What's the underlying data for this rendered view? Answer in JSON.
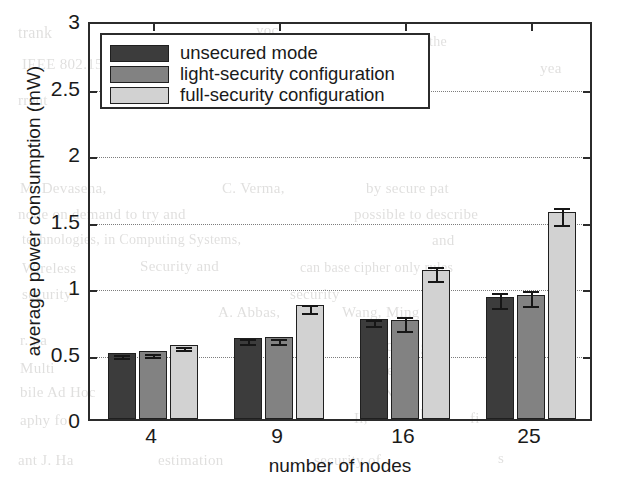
{
  "chart_data": {
    "type": "bar",
    "title": "",
    "xlabel": "number of nodes",
    "ylabel": "average power consumption (mW)",
    "categories": [
      "4",
      "9",
      "16",
      "25"
    ],
    "ylim": [
      0,
      3
    ],
    "yticks": [
      "0",
      "0.5",
      "1",
      "1.5",
      "2",
      "2.5",
      "3"
    ],
    "ytick_values": [
      0,
      0.5,
      1,
      1.5,
      2,
      2.5,
      3
    ],
    "grid": "dotted horizontal gridlines",
    "legend_position": "upper left (inside axes)",
    "series": [
      {
        "name": "unsecured mode",
        "color": "#3c3c3c",
        "values": [
          0.5,
          0.61,
          0.755,
          0.92
        ],
        "errors": [
          0.012,
          0.018,
          0.022,
          0.055
        ]
      },
      {
        "name": "light-security configuration",
        "color": "#828282",
        "values": [
          0.51,
          0.615,
          0.745,
          0.935
        ],
        "errors": [
          0.012,
          0.02,
          0.055,
          0.055
        ]
      },
      {
        "name": "full-security configuration",
        "color": "#d2d2d2",
        "values": [
          0.56,
          0.86,
          1.12,
          1.555
        ],
        "errors": [
          0.013,
          0.03,
          0.055,
          0.065
        ]
      }
    ]
  },
  "figure": {
    "axis_color": "#2b2b2b",
    "grid_color": "#7d7d7d",
    "background": "#ffffff"
  },
  "bleed_text": [
    {
      "t": "trank",
      "x": 18,
      "y": 24,
      "s": 16
    },
    {
      "t": "yoc",
      "x": 256,
      "y": 22,
      "s": 15
    },
    {
      "t": "IEEE 802.15.4 standard",
      "x": 22,
      "y": 56,
      "s": 15
    },
    {
      "t": "national",
      "x": 352,
      "y": 58,
      "s": 15
    },
    {
      "t": "rrent",
      "x": 18,
      "y": 92,
      "s": 15
    },
    {
      "t": "it in a master-slave scheme",
      "x": 210,
      "y": 96,
      "s": 15
    },
    {
      "t": "M. Devasena,",
      "x": 20,
      "y": 180,
      "s": 15
    },
    {
      "t": "C. Verma,",
      "x": 222,
      "y": 180,
      "s": 15
    },
    {
      "t": "by secure pat",
      "x": 366,
      "y": 180,
      "s": 15
    },
    {
      "t": "node on demand to try and",
      "x": 18,
      "y": 206,
      "s": 15
    },
    {
      "t": "possible to describe",
      "x": 354,
      "y": 206,
      "s": 15
    },
    {
      "t": "technologies, in Computing Systems,",
      "x": 22,
      "y": 232,
      "s": 14
    },
    {
      "t": "and",
      "x": 432,
      "y": 232,
      "s": 15
    },
    {
      "t": "Wireless",
      "x": 22,
      "y": 260,
      "s": 15
    },
    {
      "t": "Security and",
      "x": 140,
      "y": 258,
      "s": 15
    },
    {
      "t": "can base cipher only rules",
      "x": 300,
      "y": 260,
      "s": 14
    },
    {
      "t": "security",
      "x": 22,
      "y": 286,
      "s": 15
    },
    {
      "t": "security",
      "x": 290,
      "y": 286,
      "s": 15
    },
    {
      "t": "A. Abbas,",
      "x": 218,
      "y": 304,
      "s": 15
    },
    {
      "t": "Wang, Ming",
      "x": 342,
      "y": 304,
      "s": 15
    },
    {
      "t": "I. Th",
      "x": 506,
      "y": 304,
      "s": 15
    },
    {
      "t": "r. pa",
      "x": 20,
      "y": 332,
      "s": 15
    },
    {
      "t": "Secure grid",
      "x": 368,
      "y": 336,
      "s": 17
    },
    {
      "t": "Multi",
      "x": 20,
      "y": 360,
      "s": 15
    },
    {
      "t": "is the",
      "x": 360,
      "y": 362,
      "s": 15
    },
    {
      "t": "bile Ad Hoc",
      "x": 20,
      "y": 384,
      "s": 15
    },
    {
      "t": "w. Netw",
      "x": 366,
      "y": 386,
      "s": 15
    },
    {
      "t": "aphy fo",
      "x": 20,
      "y": 412,
      "s": 15
    },
    {
      "t": "Il,",
      "x": 354,
      "y": 410,
      "s": 15
    },
    {
      "t": "lh",
      "x": 420,
      "y": 406,
      "s": 15
    },
    {
      "t": "fi",
      "x": 470,
      "y": 410,
      "s": 15
    },
    {
      "t": "ant J. Ha",
      "x": 18,
      "y": 452,
      "s": 15
    },
    {
      "t": "estimation",
      "x": 158,
      "y": 452,
      "s": 15
    },
    {
      "t": "security of",
      "x": 314,
      "y": 452,
      "s": 15
    },
    {
      "t": "s",
      "x": 498,
      "y": 450,
      "s": 15
    },
    {
      "t": "n the",
      "x": 418,
      "y": 34,
      "s": 14
    },
    {
      "t": "yea",
      "x": 540,
      "y": 60,
      "s": 15
    }
  ]
}
